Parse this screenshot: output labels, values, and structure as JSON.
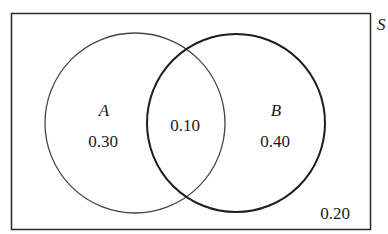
{
  "diagram": {
    "type": "venn",
    "sample_space": {
      "label": "S",
      "outside_value": "0.20"
    },
    "sets": [
      {
        "name": "A",
        "only_value": "0.30"
      },
      {
        "name": "B",
        "only_value": "0.40"
      }
    ],
    "intersection": {
      "sets": [
        "A",
        "B"
      ],
      "value": "0.10"
    },
    "colors": {
      "stroke": "#2a2a2a",
      "background": "#ffffff"
    }
  }
}
